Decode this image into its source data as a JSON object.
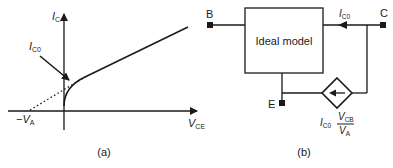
{
  "panel_a": {
    "caption": "(a)",
    "y_axis_label": "I",
    "y_axis_sub": "C",
    "x_axis_label": "V",
    "x_axis_sub": "CE",
    "intercept_label_prefix": "−V",
    "intercept_label_sub": "A",
    "annotation_label": "I",
    "annotation_sub": "C0"
  },
  "panel_b": {
    "caption": "(b)",
    "block_label": "Ideal model",
    "terminal_base": "B",
    "terminal_collector": "C",
    "terminal_emitter": "E",
    "current_label": "I",
    "current_sub": "C0",
    "source_prefix": "I",
    "source_prefix_sub": "C0",
    "source_num": "V",
    "source_num_sub": "CB",
    "source_den": "V",
    "source_den_sub": "A"
  },
  "colors": {
    "stroke": "#1a1a1a",
    "background": "#ffffff"
  }
}
